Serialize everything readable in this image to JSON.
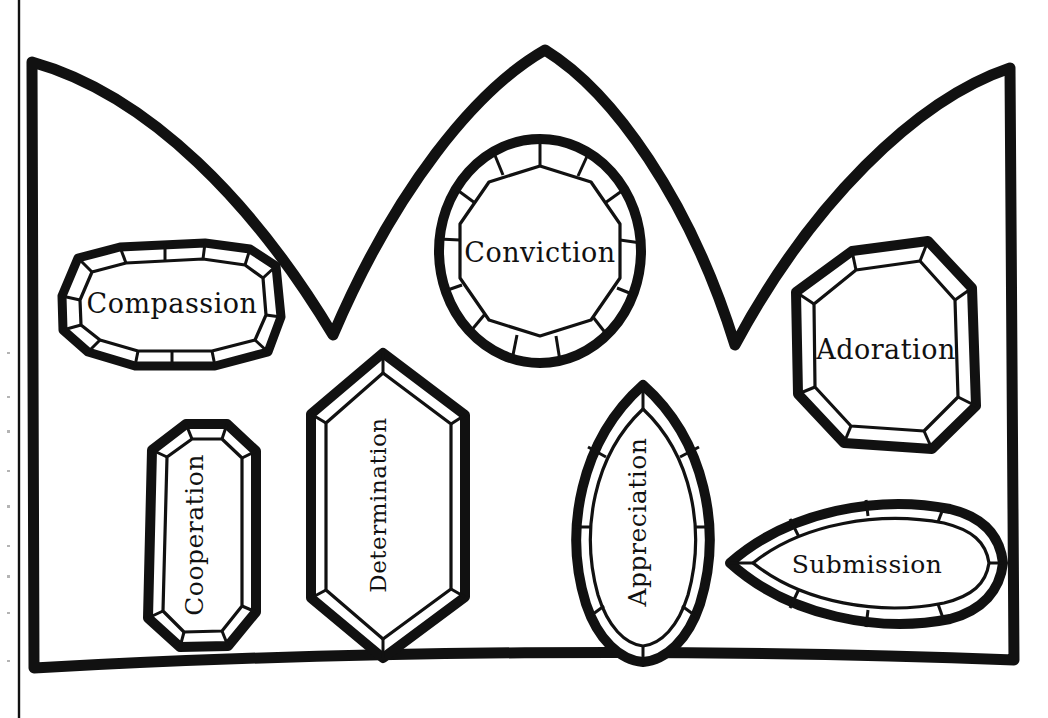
{
  "page": {
    "background_color": "#ffffff",
    "ink_color": "#111111",
    "style": "black and white line art coloring page",
    "width": 1048,
    "height": 718
  },
  "page_edge": {
    "name": "left-page-margin-rule",
    "visible": true,
    "x": 18,
    "color": "#111111"
  },
  "crown": {
    "name": "crown-outline",
    "peaks": 3,
    "base_band": "thick horizontal band at bottom",
    "stroke_color": "#111111",
    "fill_color": "#ffffff"
  },
  "gems": [
    {
      "id": "compassion",
      "label": "Compassion",
      "shape": "cushion-octagon",
      "orientation": "horizontal",
      "facets": 12,
      "position": "upper-left"
    },
    {
      "id": "conviction",
      "label": "Conviction",
      "shape": "round-brilliant",
      "orientation": "horizontal",
      "facets": 14,
      "position": "top-center-peak"
    },
    {
      "id": "adoration",
      "label": "Adoration",
      "shape": "octagon",
      "orientation": "horizontal",
      "facets": 8,
      "position": "upper-right"
    },
    {
      "id": "cooperation",
      "label": "Cooperation",
      "shape": "emerald-cut",
      "orientation": "vertical",
      "facets": 8,
      "position": "lower-left"
    },
    {
      "id": "determination",
      "label": "Determination",
      "shape": "hexagon",
      "orientation": "vertical",
      "facets": 6,
      "position": "lower-center-left"
    },
    {
      "id": "appreciation",
      "label": "Appreciation",
      "shape": "marquise",
      "orientation": "vertical",
      "facets": 8,
      "position": "lower-center-right"
    },
    {
      "id": "submission",
      "label": "Submission",
      "shape": "marquise",
      "orientation": "horizontal",
      "facets": 10,
      "position": "lower-right"
    }
  ]
}
